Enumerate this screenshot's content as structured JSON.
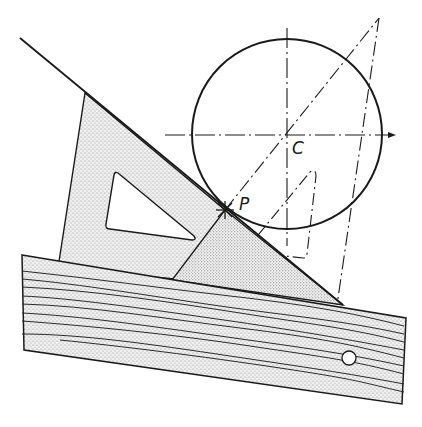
{
  "diagram": {
    "title": "",
    "labels": {
      "point_p": "P",
      "center_c": "C"
    },
    "colors": {
      "ink": "#1a1a1a",
      "stipple": "#8a8a8a",
      "paper": "#ffffff"
    },
    "elements": [
      {
        "id": "circle",
        "type": "circle",
        "center": [
          287,
          134
        ],
        "radius": 95
      },
      {
        "id": "tangent-line",
        "type": "line",
        "from": [
          20,
          38
        ],
        "to": [
          343,
          305
        ]
      },
      {
        "id": "horizontal-centerline",
        "type": "dash-dot-line",
        "from": [
          165,
          135
        ],
        "to": [
          395,
          135
        ],
        "arrow": true
      },
      {
        "id": "vertical-centerline",
        "type": "dash-dot-line",
        "from": [
          287,
          28
        ],
        "to": [
          287,
          245
        ]
      },
      {
        "id": "set-square-45",
        "type": "shaded-triangle"
      },
      {
        "id": "set-square-30-60",
        "type": "shaded-triangle"
      },
      {
        "id": "ghost-set-square",
        "type": "dashed-triangle"
      },
      {
        "id": "ruler",
        "type": "wood-grain-rect"
      }
    ]
  }
}
